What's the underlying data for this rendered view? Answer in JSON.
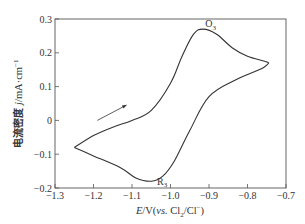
{
  "chart_data": {
    "type": "line",
    "title": "",
    "xlabel": "E/V(vs. Cl2/Cl−)",
    "xlabel_parts": {
      "var": "E",
      "unit": "/V(",
      "vs": "vs.",
      "ref_a": " Cl",
      "sub": "2",
      "ref_b": "/Cl",
      "sup": "−",
      "close": ")"
    },
    "ylabel": "电流密度 j/mA·cm−1",
    "ylabel_parts": {
      "cn": "电流密度 ",
      "var": "j",
      "unit": "/mA·cm",
      "sup": "−1"
    },
    "xlim": [
      -1.3,
      -0.7
    ],
    "ylim": [
      -0.2,
      0.3
    ],
    "x_ticks": [
      -1.3,
      -1.2,
      -1.1,
      -1.0,
      -0.9,
      -0.8,
      -0.7
    ],
    "x_tick_labels": [
      "−1.3",
      "−1.2",
      "−1.1",
      "−1.0",
      "−0.9",
      "−0.8",
      "−0.7"
    ],
    "y_ticks": [
      -0.2,
      -0.1,
      0,
      0.1,
      0.2,
      0.3
    ],
    "y_tick_labels": [
      "−0.2",
      "−0.1",
      "0",
      "0.1",
      "0.2",
      "0.3"
    ],
    "grid": false,
    "legend": null,
    "series": [
      {
        "name": "cyclic voltammogram",
        "closed": true,
        "points": [
          [
            -1.25,
            -0.08
          ],
          [
            -1.2,
            -0.045
          ],
          [
            -1.15,
            -0.02
          ],
          [
            -1.1,
            0.0
          ],
          [
            -1.05,
            0.03
          ],
          [
            -1.0,
            0.11
          ],
          [
            -0.97,
            0.19
          ],
          [
            -0.94,
            0.255
          ],
          [
            -0.915,
            0.27
          ],
          [
            -0.88,
            0.255
          ],
          [
            -0.84,
            0.215
          ],
          [
            -0.8,
            0.19
          ],
          [
            -0.755,
            0.175
          ],
          [
            -0.745,
            0.17
          ],
          [
            -0.76,
            0.155
          ],
          [
            -0.83,
            0.12
          ],
          [
            -0.9,
            0.07
          ],
          [
            -0.95,
            -0.03
          ],
          [
            -0.99,
            -0.12
          ],
          [
            -1.02,
            -0.165
          ],
          [
            -1.05,
            -0.18
          ],
          [
            -1.09,
            -0.17
          ],
          [
            -1.13,
            -0.14
          ],
          [
            -1.2,
            -0.105
          ],
          [
            -1.25,
            -0.08
          ]
        ]
      }
    ],
    "annotations": [
      {
        "text": "O",
        "sub": "3",
        "x": -0.91,
        "y": 0.275,
        "meaning": "oxidation peak"
      },
      {
        "text": "R",
        "sub": "3",
        "x": -1.035,
        "y": -0.19,
        "meaning": "reduction peak"
      },
      {
        "type": "arrow",
        "from": [
          -1.19,
          0.0
        ],
        "to": [
          -1.115,
          0.045
        ],
        "meaning": "scan direction"
      }
    ]
  },
  "labels": {
    "peak_o_main": "O",
    "peak_o_sub": "3",
    "peak_r_main": "R",
    "peak_r_sub": "3"
  }
}
